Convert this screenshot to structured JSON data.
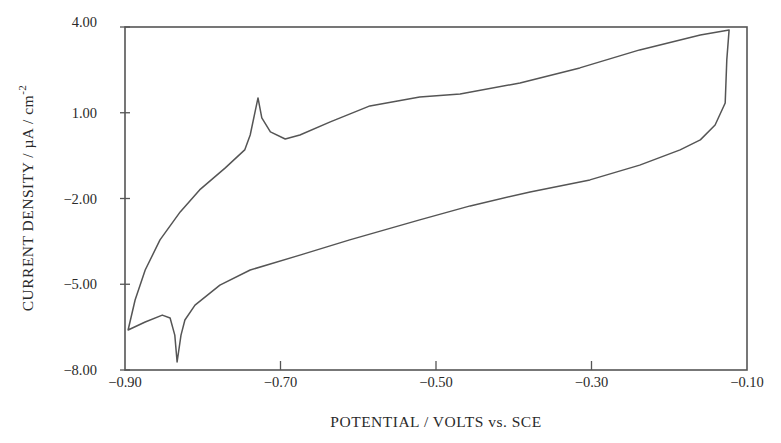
{
  "chart_data": {
    "type": "line",
    "title": "",
    "xlabel": "POTENTIAL / VOLTS vs. SCE",
    "ylabel": "CURRENT DENSITY / µA / cm",
    "ylabel_superscript": "-2",
    "xlim": [
      -0.9,
      -0.1
    ],
    "ylim": [
      -8.0,
      4.0
    ],
    "x_ticks": [
      -0.9,
      -0.7,
      -0.5,
      -0.3,
      -0.1
    ],
    "x_tick_labels": [
      "−0.90",
      "−0.70",
      "−0.50",
      "−0.30",
      "−0.10"
    ],
    "y_ticks": [
      4.0,
      1.0,
      -2.0,
      -5.0,
      -8.0
    ],
    "y_tick_labels": [
      "4.00",
      "1.00",
      "−2.00",
      "−5.00",
      "−8.00"
    ],
    "grid": false,
    "legend": null,
    "series": [
      {
        "name": "cyclic voltammogram",
        "color": "#555555",
        "closed": true,
        "x": [
          -0.896,
          -0.887,
          -0.874,
          -0.855,
          -0.829,
          -0.804,
          -0.771,
          -0.746,
          -0.739,
          -0.729,
          -0.724,
          -0.713,
          -0.694,
          -0.675,
          -0.636,
          -0.585,
          -0.521,
          -0.469,
          -0.392,
          -0.315,
          -0.238,
          -0.16,
          -0.123,
          -0.126,
          -0.128,
          -0.141,
          -0.16,
          -0.186,
          -0.238,
          -0.302,
          -0.379,
          -0.456,
          -0.521,
          -0.611,
          -0.675,
          -0.739,
          -0.778,
          -0.81,
          -0.823,
          -0.828,
          -0.833,
          -0.836,
          -0.842,
          -0.852,
          -0.874,
          -0.896
        ],
        "y": [
          -6.6,
          -5.55,
          -4.5,
          -3.45,
          -2.47,
          -1.7,
          -0.93,
          -0.3,
          0.22,
          1.52,
          0.82,
          0.33,
          0.08,
          0.22,
          0.68,
          1.24,
          1.55,
          1.66,
          2.04,
          2.57,
          3.2,
          3.72,
          3.9,
          2.85,
          1.34,
          0.57,
          0.05,
          -0.3,
          -0.83,
          -1.35,
          -1.77,
          -2.26,
          -2.75,
          -3.45,
          -3.98,
          -4.5,
          -5.03,
          -5.73,
          -6.25,
          -6.78,
          -7.72,
          -6.78,
          -6.18,
          -6.08,
          -6.32,
          -6.6
        ]
      }
    ],
    "annotations": [
      {
        "text": "anodic peak",
        "x": -0.729,
        "y": 1.52
      },
      {
        "text": "cathodic spike",
        "x": -0.833,
        "y": -7.72
      }
    ]
  },
  "plot_area": {
    "left": 125,
    "top": 27,
    "right": 747,
    "bottom": 370
  }
}
